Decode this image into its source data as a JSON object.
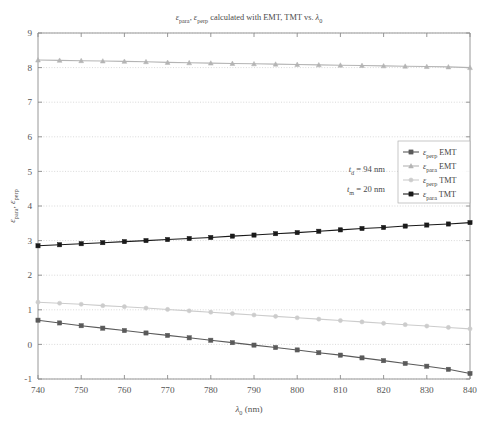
{
  "chart_data": {
    "type": "line",
    "title": "εpara, εperp calculated with EMT, TMT vs. λ0",
    "title_parts": {
      "e1": "ε",
      "sub1": "para",
      "comma": ", ",
      "e2": "ε",
      "sub2": "perp",
      "mid": " calculated with EMT, TMT vs. ",
      "lam": "λ",
      "sub3": "0"
    },
    "xlabel": "λ0 (nm)",
    "xlabel_parts": {
      "lam": "λ",
      "sub": "0",
      "unit": " (nm)"
    },
    "ylabel": "εpara, εperp",
    "ylabel_parts": {
      "e1": "ε",
      "sub1": "para",
      "comma": ", ",
      "e2": "ε",
      "sub2": "perp"
    },
    "xlim": [
      740,
      840
    ],
    "ylim": [
      -1,
      9
    ],
    "xticks": [
      740,
      750,
      760,
      770,
      780,
      790,
      800,
      810,
      820,
      830,
      840
    ],
    "yticks": [
      -1,
      0,
      1,
      2,
      3,
      4,
      5,
      6,
      7,
      8,
      9
    ],
    "grid": "horizontal-dotted",
    "legend_position": "right-middle",
    "x": [
      740,
      745,
      750,
      755,
      760,
      765,
      770,
      775,
      780,
      785,
      790,
      795,
      800,
      805,
      810,
      815,
      820,
      825,
      830,
      835,
      840
    ],
    "series": [
      {
        "name": "εperp EMT",
        "name_parts": {
          "e": "ε",
          "sub": "perp",
          "tail": " EMT"
        },
        "color": "#5a5a5a",
        "marker": "square",
        "values": [
          0.7,
          0.62,
          0.54,
          0.47,
          0.4,
          0.33,
          0.26,
          0.19,
          0.12,
          0.05,
          -0.02,
          -0.09,
          -0.16,
          -0.24,
          -0.31,
          -0.39,
          -0.47,
          -0.55,
          -0.63,
          -0.72,
          -0.84
        ]
      },
      {
        "name": "εpara EMT",
        "name_parts": {
          "e": "ε",
          "sub": "para",
          "tail": " EMT"
        },
        "color": "#b4b4b4",
        "marker": "triangle",
        "values": [
          8.22,
          8.21,
          8.2,
          8.19,
          8.18,
          8.17,
          8.15,
          8.14,
          8.13,
          8.12,
          8.11,
          8.1,
          8.09,
          8.08,
          8.07,
          8.06,
          8.05,
          8.04,
          8.03,
          8.02,
          8.0
        ]
      },
      {
        "name": "εperp TMT",
        "name_parts": {
          "e": "ε",
          "sub": "perp",
          "tail": " TMT"
        },
        "color": "#cccccc",
        "marker": "circle",
        "values": [
          1.22,
          1.19,
          1.16,
          1.12,
          1.09,
          1.05,
          1.01,
          0.97,
          0.93,
          0.89,
          0.85,
          0.81,
          0.77,
          0.73,
          0.69,
          0.65,
          0.61,
          0.57,
          0.53,
          0.49,
          0.45
        ]
      },
      {
        "name": "εpara TMT",
        "name_parts": {
          "e": "ε",
          "sub": "para",
          "tail": " TMT"
        },
        "color": "#1a1a1a",
        "marker": "square",
        "values": [
          2.85,
          2.88,
          2.91,
          2.94,
          2.97,
          3.0,
          3.03,
          3.06,
          3.09,
          3.13,
          3.16,
          3.2,
          3.23,
          3.27,
          3.31,
          3.35,
          3.38,
          3.42,
          3.45,
          3.48,
          3.52
        ]
      }
    ],
    "annotations": [
      {
        "name": "td-annotation",
        "text": "td = 94 nm",
        "parts": {
          "t": "t",
          "sub": "d",
          "tail": " = 94 nm"
        }
      },
      {
        "name": "tm-annotation",
        "text": "tm = 20 nm",
        "parts": {
          "t": "t",
          "sub": "m",
          "tail": " = 20 nm"
        }
      }
    ]
  }
}
